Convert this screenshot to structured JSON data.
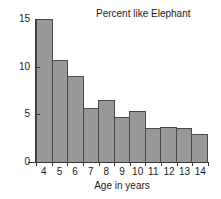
{
  "chart_data": {
    "type": "bar",
    "title": "Percent like Elephant",
    "xlabel": "Age in years",
    "ylabel": "",
    "categories": [
      "4",
      "5",
      "6",
      "7",
      "8",
      "9",
      "10",
      "11",
      "12",
      "13",
      "14"
    ],
    "values": [
      15.0,
      10.7,
      9.0,
      5.7,
      6.5,
      4.7,
      5.4,
      3.6,
      3.7,
      3.6,
      2.9
    ],
    "ylim": [
      0,
      15
    ],
    "yticks": [
      0,
      5,
      10,
      15
    ],
    "ytick_labels": [
      "0",
      "5",
      "10",
      "15"
    ],
    "xtick_labels": [
      "4",
      "5",
      "6",
      "7",
      "8",
      "9",
      "10",
      "11",
      "12",
      "13",
      "14"
    ],
    "grid": false,
    "legend": "none",
    "bar_fill_color": "#989898",
    "bar_edge_color": "#4a4a4a",
    "axis_color": "#3a3a3a",
    "background_color": "#ffffff"
  }
}
